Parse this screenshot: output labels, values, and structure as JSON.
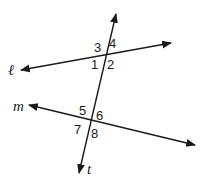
{
  "diagram": {
    "type": "parallel-lines-transversal",
    "lines": {
      "l": {
        "label": "ℓ"
      },
      "m": {
        "label": "m"
      },
      "t": {
        "label": "t"
      }
    },
    "angles": [
      "1",
      "2",
      "3",
      "4",
      "5",
      "6",
      "7",
      "8"
    ],
    "colors": {
      "stroke": "#1a1a1a",
      "background": "#ffffff"
    }
  }
}
